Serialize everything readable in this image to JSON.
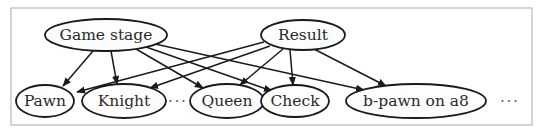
{
  "diagram": {
    "type": "bayesian-network",
    "frame": {
      "x": 11,
      "y": 8,
      "width": 521,
      "height": 117
    },
    "parents": [
      {
        "id": "game_stage",
        "label": "Game stage",
        "cx": 106,
        "cy": 35,
        "rx": 61,
        "ry": 16
      },
      {
        "id": "result",
        "label": "Result",
        "cx": 303,
        "cy": 35,
        "rx": 42,
        "ry": 15
      }
    ],
    "children": [
      {
        "id": "pawn",
        "label": "Pawn",
        "cx": 45,
        "cy": 101,
        "rx": 29,
        "ry": 16
      },
      {
        "id": "knight",
        "label": "Knight",
        "cx": 124,
        "cy": 101,
        "rx": 42,
        "ry": 17
      },
      {
        "id": "queen",
        "label": "Queen",
        "cx": 227,
        "cy": 101,
        "rx": 37,
        "ry": 17
      },
      {
        "id": "check",
        "label": "Check",
        "cx": 295,
        "cy": 101,
        "rx": 34,
        "ry": 16
      },
      {
        "id": "b_pawn_a8",
        "label": "b-pawn on a8",
        "cx": 416,
        "cy": 101,
        "rx": 70,
        "ry": 17
      }
    ],
    "ellipses": [
      {
        "text": "···",
        "x": 178,
        "y": 101
      },
      {
        "text": "···",
        "x": 510,
        "y": 101
      }
    ],
    "edges": [
      {
        "from": "game_stage",
        "to": "pawn",
        "x1": 93,
        "y1": 51,
        "x2": 63,
        "y2": 86
      },
      {
        "from": "game_stage",
        "to": "knight",
        "x1": 111,
        "y1": 51,
        "x2": 117,
        "y2": 84
      },
      {
        "from": "game_stage",
        "to": "queen",
        "x1": 136,
        "y1": 49,
        "x2": 203,
        "y2": 88
      },
      {
        "from": "game_stage",
        "to": "check",
        "x1": 146,
        "y1": 47,
        "x2": 272,
        "y2": 91
      },
      {
        "from": "game_stage",
        "to": "b_pawn_a8",
        "x1": 155,
        "y1": 44,
        "x2": 364,
        "y2": 90
      },
      {
        "from": "result",
        "to": "pawn",
        "x1": 264,
        "y1": 42,
        "x2": 77,
        "y2": 92
      },
      {
        "from": "result",
        "to": "knight",
        "x1": 270,
        "y1": 46,
        "x2": 150,
        "y2": 88
      },
      {
        "from": "result",
        "to": "queen",
        "x1": 283,
        "y1": 49,
        "x2": 240,
        "y2": 85
      },
      {
        "from": "result",
        "to": "check",
        "x1": 290,
        "y1": 50,
        "x2": 293,
        "y2": 85
      },
      {
        "from": "result",
        "to": "b_pawn_a8",
        "x1": 312,
        "y1": 48,
        "x2": 386,
        "y2": 86
      }
    ]
  },
  "labels": {
    "game_stage": "Game stage",
    "result": "Result",
    "pawn": "Pawn",
    "knight": "Knight",
    "queen": "Queen",
    "check": "Check",
    "b_pawn_a8": "b-pawn on a8",
    "ellipsis_1": "···",
    "ellipsis_2": "···"
  }
}
